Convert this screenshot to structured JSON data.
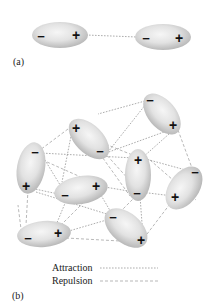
{
  "panel_a": {
    "label": "(a)",
    "molecules": [
      {
        "cx": 60,
        "cy": 35,
        "rx": 28,
        "ry": 13,
        "rot": 0,
        "minus": {
          "x": 41,
          "y": 36,
          "t": "−"
        },
        "plus": {
          "x": 76,
          "y": 35,
          "t": "+"
        }
      },
      {
        "cx": 163,
        "cy": 37,
        "rx": 28,
        "ry": 13,
        "rot": 0,
        "minus": {
          "x": 146,
          "y": 38,
          "t": "−"
        },
        "plus": {
          "x": 179,
          "y": 38,
          "t": "+"
        }
      }
    ],
    "bonds": [
      {
        "type": "attraction",
        "x1": 86,
        "y1": 35,
        "x2": 137,
        "y2": 37
      }
    ]
  },
  "panel_b": {
    "label": "(b)",
    "molecules": [
      {
        "name": "top-right",
        "cx": 162,
        "cy": 114,
        "rx": 24,
        "ry": 14,
        "rot": 50,
        "minus": {
          "x": 150,
          "y": 100,
          "t": "−"
        },
        "plus": {
          "x": 173,
          "y": 125,
          "t": "+"
        }
      },
      {
        "name": "upper-mid",
        "cx": 89,
        "cy": 139,
        "rx": 25,
        "ry": 14,
        "rot": 45,
        "minus": {
          "x": 100,
          "y": 151,
          "t": "−"
        },
        "plus": {
          "x": 76,
          "y": 128,
          "t": "+"
        }
      },
      {
        "name": "left",
        "cx": 31,
        "cy": 168,
        "rx": 14,
        "ry": 26,
        "rot": 10,
        "minus": {
          "x": 35,
          "y": 152,
          "t": "−"
        },
        "plus": {
          "x": 26,
          "y": 186,
          "t": "+"
        }
      },
      {
        "name": "center-vertical",
        "cx": 138,
        "cy": 175,
        "rx": 13,
        "ry": 26,
        "rot": 0,
        "minus": {
          "x": 137,
          "y": 193,
          "t": "−"
        },
        "plus": {
          "x": 138,
          "y": 160,
          "t": "+"
        }
      },
      {
        "name": "right",
        "cx": 184,
        "cy": 188,
        "rx": 24,
        "ry": 15,
        "rot": -55,
        "minus": {
          "x": 195,
          "y": 172,
          "t": "−"
        },
        "plus": {
          "x": 175,
          "y": 197,
          "t": "+"
        }
      },
      {
        "name": "middle",
        "cx": 81,
        "cy": 190,
        "rx": 27,
        "ry": 14,
        "rot": -10,
        "minus": {
          "x": 65,
          "y": 195,
          "t": "−"
        },
        "plus": {
          "x": 96,
          "y": 186,
          "t": "+"
        }
      },
      {
        "name": "bottom-left",
        "cx": 44,
        "cy": 234,
        "rx": 27,
        "ry": 13,
        "rot": -5,
        "minus": {
          "x": 28,
          "y": 238,
          "t": "−"
        },
        "plus": {
          "x": 58,
          "y": 233,
          "t": "+"
        }
      },
      {
        "name": "bottom-middle",
        "cx": 126,
        "cy": 228,
        "rx": 25,
        "ry": 15,
        "rot": 40,
        "minus": {
          "x": 113,
          "y": 217,
          "t": "−"
        },
        "plus": {
          "x": 141,
          "y": 240,
          "t": "+"
        }
      }
    ],
    "bonds": [
      {
        "type": "attraction",
        "x1": 145,
        "y1": 101,
        "x2": 98,
        "y2": 114
      },
      {
        "type": "repulsion",
        "x1": 72,
        "y1": 126,
        "x2": 40,
        "y2": 150
      },
      {
        "type": "attraction",
        "x1": 146,
        "y1": 104,
        "x2": 108,
        "y2": 152
      },
      {
        "type": "attraction",
        "x1": 106,
        "y1": 153,
        "x2": 175,
        "y2": 128
      },
      {
        "type": "repulsion",
        "x1": 178,
        "y1": 130,
        "x2": 192,
        "y2": 168
      },
      {
        "type": "attraction",
        "x1": 40,
        "y1": 153,
        "x2": 134,
        "y2": 158
      },
      {
        "type": "repulsion",
        "x1": 38,
        "y1": 158,
        "x2": 92,
        "y2": 182
      },
      {
        "type": "attraction",
        "x1": 72,
        "y1": 131,
        "x2": 62,
        "y2": 182
      },
      {
        "type": "repulsion",
        "x1": 78,
        "y1": 133,
        "x2": 135,
        "y2": 156
      },
      {
        "type": "repulsion",
        "x1": 100,
        "y1": 154,
        "x2": 130,
        "y2": 196
      },
      {
        "type": "attraction",
        "x1": 142,
        "y1": 158,
        "x2": 193,
        "y2": 172
      },
      {
        "type": "attraction",
        "x1": 140,
        "y1": 192,
        "x2": 173,
        "y2": 196
      },
      {
        "type": "attraction",
        "x1": 30,
        "y1": 188,
        "x2": 63,
        "y2": 195
      },
      {
        "type": "repulsion",
        "x1": 28,
        "y1": 190,
        "x2": 26,
        "y2": 225
      },
      {
        "type": "attraction",
        "x1": 36,
        "y1": 192,
        "x2": 110,
        "y2": 215
      },
      {
        "type": "attraction",
        "x1": 99,
        "y1": 186,
        "x2": 134,
        "y2": 192
      },
      {
        "type": "repulsion",
        "x1": 98,
        "y1": 188,
        "x2": 58,
        "y2": 228
      },
      {
        "type": "attraction",
        "x1": 68,
        "y1": 196,
        "x2": 54,
        "y2": 230
      },
      {
        "type": "attraction",
        "x1": 98,
        "y1": 190,
        "x2": 112,
        "y2": 214
      },
      {
        "type": "repulsion",
        "x1": 136,
        "y1": 196,
        "x2": 118,
        "y2": 214
      },
      {
        "type": "attraction",
        "x1": 140,
        "y1": 196,
        "x2": 143,
        "y2": 237
      },
      {
        "type": "repulsion",
        "x1": 173,
        "y1": 200,
        "x2": 144,
        "y2": 238
      },
      {
        "type": "attraction",
        "x1": 62,
        "y1": 233,
        "x2": 110,
        "y2": 219
      },
      {
        "type": "repulsion",
        "x1": 66,
        "y1": 238,
        "x2": 138,
        "y2": 242
      },
      {
        "type": "repulsion",
        "x1": 22,
        "y1": 237,
        "x2": 18,
        "y2": 205
      },
      {
        "type": "attraction",
        "x1": 40,
        "y1": 152,
        "x2": 65,
        "y2": 193
      },
      {
        "type": "repulsion",
        "x1": 150,
        "y1": 160,
        "x2": 196,
        "y2": 200
      },
      {
        "type": "attraction",
        "x1": 178,
        "y1": 126,
        "x2": 142,
        "y2": 158
      },
      {
        "type": "repulsion",
        "x1": 104,
        "y1": 152,
        "x2": 140,
        "y2": 192
      }
    ]
  },
  "legend": {
    "attraction_label": "Attraction",
    "repulsion_label": "Repulsion"
  },
  "colors": {
    "molecule_center": "#f4f4f4",
    "molecule_edge": "#bdbdbd",
    "bond": "#8a8a8a",
    "text": "#222222"
  }
}
